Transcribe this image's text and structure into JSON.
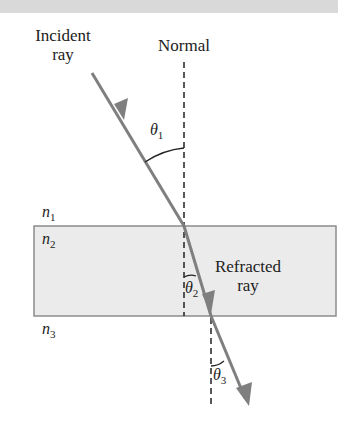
{
  "labels": {
    "incident_line1": "Incident",
    "incident_line2": "ray",
    "normal": "Normal",
    "refracted_line1": "Refracted",
    "refracted_line2": "ray"
  },
  "media": {
    "n1": {
      "sym": "n",
      "sub": "1"
    },
    "n2": {
      "sym": "n",
      "sub": "2"
    },
    "n3": {
      "sym": "n",
      "sub": "3"
    }
  },
  "angles": {
    "theta1": {
      "sym": "θ",
      "sub": "1"
    },
    "theta2": {
      "sym": "θ",
      "sub": "2"
    },
    "theta3": {
      "sym": "θ",
      "sub": "3"
    }
  },
  "colors": {
    "ray": "#7f7f7f",
    "slab_fill": "#ebebeb",
    "slab_border": "#8c8c8c",
    "top_band": "#d9d9d9",
    "text": "#222222"
  }
}
